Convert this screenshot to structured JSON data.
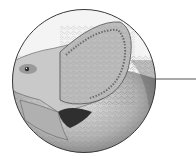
{
  "illustration": {
    "subject": "dinosaur-head-with-frill",
    "style": "grayscale-pencil",
    "shape": "circle",
    "colors": {
      "background": "#ffffff",
      "outline": "#3a3a3a",
      "leader_line": "#555555",
      "skin_light": "#d8d8d8",
      "skin_mid": "#a8a8a8",
      "skin_dark": "#4a4a4a"
    }
  },
  "leader_line": {
    "present": true
  }
}
